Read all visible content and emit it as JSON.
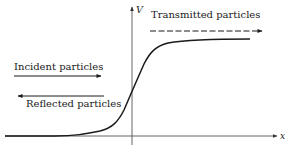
{
  "diagram": {
    "type": "potential-step-scattering",
    "axes": {
      "x_label": "x",
      "y_label": "V"
    },
    "labels": {
      "incident": "Incident particles",
      "reflected": "Reflected particles",
      "transmitted": "Transmitted particles"
    },
    "arrows": {
      "incident": {
        "direction": "right",
        "style": "solid"
      },
      "reflected": {
        "direction": "left",
        "style": "solid"
      },
      "transmitted": {
        "direction": "right",
        "style": "dashed"
      }
    },
    "curve": {
      "description": "smooth step potential rising from 0 on the left to a constant plateau on the right",
      "shape": "sigmoid"
    },
    "colors": {
      "ink": "#1a1a1a",
      "axis": "#555555",
      "background": "#ffffff"
    }
  }
}
